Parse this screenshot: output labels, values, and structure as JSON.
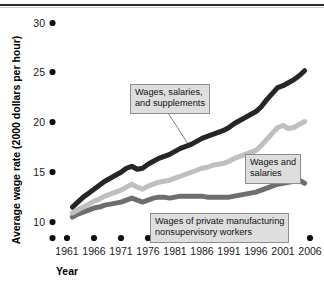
{
  "figure": {
    "axis_titles": {
      "y": "Average wage rate (2000 dollars per hour)",
      "x": "Year"
    },
    "y_ticks": [
      "10",
      "15",
      "20",
      "25",
      "30"
    ],
    "x_ticks": [
      "1961",
      "1966",
      "1971",
      "1976",
      "1981",
      "1986",
      "1991",
      "1996",
      "2001",
      "2006"
    ],
    "annotations": {
      "wages_salaries_supplements": {
        "line1": "Wages, salaries,",
        "line2": "and supplements"
      },
      "wages_and_salaries": {
        "line1": "Wages and",
        "line2": "salaries"
      },
      "private_manufacturing": {
        "line1": "Wages of private manufacturing",
        "line2": "nonsupervisory workers"
      }
    },
    "colors": {
      "series_total_compensation": "#262626",
      "series_wages_salaries": "#bfbfbf",
      "series_manufacturing": "#6e6e6e",
      "callout_fill": "#dedede",
      "callout_border": "#8c8c8c",
      "axis_text": "#1a1a1a"
    }
  },
  "chart_data": {
    "type": "line",
    "title": "",
    "xlabel": "Year",
    "ylabel": "Average wage rate (2000 dollars per hour)",
    "xlim": [
      1961,
      2007
    ],
    "ylim": [
      10,
      30
    ],
    "grid": false,
    "legend_position": "inline-callouts",
    "x": [
      1962,
      1963,
      1964,
      1965,
      1966,
      1967,
      1968,
      1969,
      1970,
      1971,
      1972,
      1973,
      1974,
      1975,
      1976,
      1977,
      1978,
      1979,
      1980,
      1981,
      1982,
      1983,
      1984,
      1985,
      1986,
      1987,
      1988,
      1989,
      1990,
      1991,
      1992,
      1993,
      1994,
      1995,
      1996,
      1997,
      1998,
      1999,
      2000,
      2001,
      2002,
      2003,
      2004,
      2005
    ],
    "series": [
      {
        "name": "Wages, salaries, and supplements",
        "color": "#262626",
        "values": [
          11.5,
          12.0,
          12.5,
          12.9,
          13.3,
          13.7,
          14.1,
          14.4,
          14.7,
          15.0,
          15.4,
          15.6,
          15.3,
          15.4,
          15.8,
          16.1,
          16.4,
          16.6,
          16.8,
          17.1,
          17.4,
          17.6,
          17.8,
          18.1,
          18.4,
          18.6,
          18.8,
          19.0,
          19.2,
          19.5,
          19.9,
          20.2,
          20.5,
          20.8,
          21.1,
          21.6,
          22.3,
          22.9,
          23.5,
          23.7,
          24.0,
          24.3,
          24.7,
          25.2
        ]
      },
      {
        "name": "Wages and salaries",
        "color": "#bfbfbf",
        "values": [
          10.9,
          11.2,
          11.5,
          11.8,
          12.1,
          12.3,
          12.6,
          12.8,
          13.0,
          13.2,
          13.5,
          13.8,
          13.5,
          13.3,
          13.6,
          13.8,
          14.0,
          14.1,
          14.2,
          14.4,
          14.6,
          14.8,
          15.0,
          15.2,
          15.4,
          15.5,
          15.7,
          15.8,
          15.9,
          16.1,
          16.4,
          16.6,
          16.8,
          17.0,
          17.2,
          17.7,
          18.3,
          18.9,
          19.5,
          19.7,
          19.4,
          19.5,
          19.8,
          20.1
        ]
      },
      {
        "name": "Wages of private manufacturing nonsupervisory workers",
        "color": "#6e6e6e",
        "values": [
          10.5,
          10.8,
          11.0,
          11.2,
          11.4,
          11.5,
          11.7,
          11.8,
          11.9,
          12.0,
          12.2,
          12.4,
          12.2,
          12.0,
          12.2,
          12.4,
          12.5,
          12.5,
          12.4,
          12.5,
          12.6,
          12.6,
          12.6,
          12.6,
          12.6,
          12.5,
          12.5,
          12.5,
          12.5,
          12.5,
          12.6,
          12.7,
          12.8,
          12.9,
          13.0,
          13.2,
          13.4,
          13.6,
          13.8,
          13.9,
          14.0,
          14.1,
          14.2,
          13.9
        ]
      }
    ],
    "annotations": [
      {
        "text": "Wages, salaries, and supplements",
        "target_series": "Wages, salaries, and supplements"
      },
      {
        "text": "Wages and salaries",
        "target_series": "Wages and salaries"
      },
      {
        "text": "Wages of private manufacturing nonsupervisory workers",
        "target_series": "Wages of private manufacturing nonsupervisory workers"
      }
    ]
  }
}
